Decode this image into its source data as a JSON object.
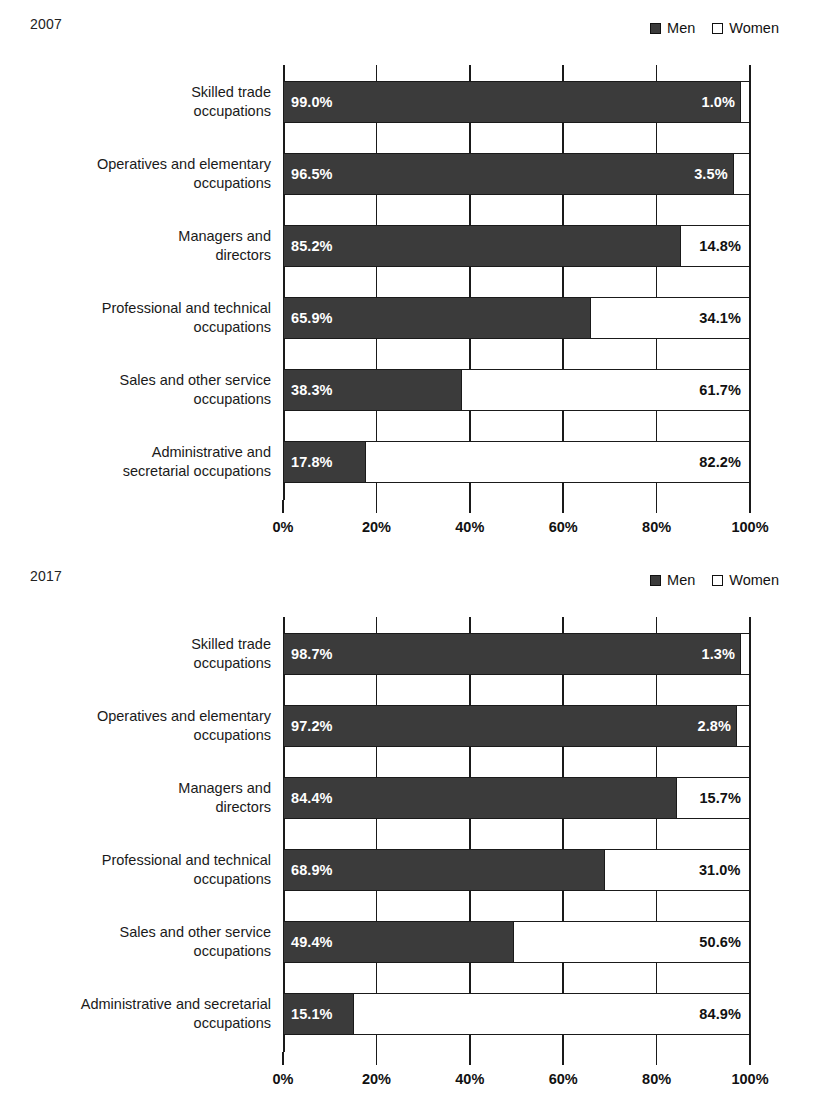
{
  "charts": [
    {
      "year": "2007",
      "legend": [
        {
          "label": "Men",
          "swatch": "filled-square-icon",
          "color": "#3b3b3b"
        },
        {
          "label": "Women",
          "swatch": "open-square-icon",
          "color": "#ffffff"
        }
      ],
      "x_tick_labels": [
        "0%",
        "20%",
        "40%",
        "60%",
        "80%",
        "100%"
      ],
      "rows": [
        {
          "label": "Skilled trade\noccupations",
          "men": 99.0,
          "women": 1.0,
          "men_label": "99.0%",
          "women_label": "1.0%",
          "women_label_outside": true
        },
        {
          "label": "Operatives and elementary\noccupations",
          "men": 96.5,
          "women": 3.5,
          "men_label": "96.5%",
          "women_label": "3.5%",
          "women_label_outside": true
        },
        {
          "label": "Managers and\ndirectors",
          "men": 85.2,
          "women": 14.8,
          "men_label": "85.2%",
          "women_label": "14.8%",
          "women_label_outside": false
        },
        {
          "label": "Professional and technical\noccupations",
          "men": 65.9,
          "women": 34.1,
          "men_label": "65.9%",
          "women_label": "34.1%",
          "women_label_outside": false
        },
        {
          "label": "Sales and other service\noccupations",
          "men": 38.3,
          "women": 61.7,
          "men_label": "38.3%",
          "women_label": "61.7%",
          "women_label_outside": false
        },
        {
          "label": "Administrative and\nsecretarial occupations",
          "men": 17.8,
          "women": 82.2,
          "men_label": "17.8%",
          "women_label": "82.2%",
          "women_label_outside": false
        }
      ]
    },
    {
      "year": "2017",
      "legend": [
        {
          "label": "Men",
          "swatch": "filled-square-icon",
          "color": "#3b3b3b"
        },
        {
          "label": "Women",
          "swatch": "open-square-icon",
          "color": "#ffffff"
        }
      ],
      "x_tick_labels": [
        "0%",
        "20%",
        "40%",
        "60%",
        "80%",
        "100%"
      ],
      "rows": [
        {
          "label": "Skilled trade\noccupations",
          "men": 98.7,
          "women": 1.3,
          "men_label": "98.7%",
          "women_label": "1.3%",
          "women_label_outside": true
        },
        {
          "label": "Operatives and elementary\noccupations",
          "men": 97.2,
          "women": 2.8,
          "men_label": "97.2%",
          "women_label": "2.8%",
          "women_label_outside": true
        },
        {
          "label": "Managers and\ndirectors",
          "men": 84.4,
          "women": 15.7,
          "men_label": "84.4%",
          "women_label": "15.7%",
          "women_label_outside": false
        },
        {
          "label": "Professional and technical\noccupations",
          "men": 68.9,
          "women": 31.0,
          "men_label": "68.9%",
          "women_label": "31.0%",
          "women_label_outside": false
        },
        {
          "label": "Sales and other service\noccupations",
          "men": 49.4,
          "women": 50.6,
          "men_label": "49.4%",
          "women_label": "50.6%",
          "women_label_outside": false
        },
        {
          "label": "Administrative and secretarial\noccupations",
          "men": 15.1,
          "women": 84.9,
          "men_label": "15.1%",
          "women_label": "84.9%",
          "women_label_outside": false
        }
      ]
    }
  ],
  "chart_data": [
    {
      "type": "bar",
      "orientation": "horizontal",
      "stacked": true,
      "normalized_to_100": true,
      "title": "2007",
      "xlabel": "",
      "ylabel": "",
      "xlim": [
        0,
        100
      ],
      "xticks": [
        0,
        20,
        40,
        60,
        80,
        100
      ],
      "xtick_labels": [
        "0%",
        "20%",
        "40%",
        "60%",
        "80%",
        "100%"
      ],
      "grid": "vertical",
      "legend_position": "top-right",
      "categories": [
        "Skilled trade occupations",
        "Operatives and elementary occupations",
        "Managers and directors",
        "Professional and technical occupations",
        "Sales and other service occupations",
        "Administrative and secretarial occupations"
      ],
      "series": [
        {
          "name": "Men",
          "color": "#3b3b3b",
          "values": [
            99.0,
            96.5,
            85.2,
            65.9,
            38.3,
            17.8
          ]
        },
        {
          "name": "Women",
          "color": "#ffffff",
          "values": [
            1.0,
            3.5,
            14.8,
            34.1,
            61.7,
            82.2
          ]
        }
      ],
      "data_labels": [
        [
          "99.0%",
          "1.0%"
        ],
        [
          "96.5%",
          "3.5%"
        ],
        [
          "85.2%",
          "14.8%"
        ],
        [
          "65.9%",
          "34.1%"
        ],
        [
          "38.3%",
          "61.7%"
        ],
        [
          "17.8%",
          "82.2%"
        ]
      ]
    },
    {
      "type": "bar",
      "orientation": "horizontal",
      "stacked": true,
      "normalized_to_100": true,
      "title": "2017",
      "xlabel": "",
      "ylabel": "",
      "xlim": [
        0,
        100
      ],
      "xticks": [
        0,
        20,
        40,
        60,
        80,
        100
      ],
      "xtick_labels": [
        "0%",
        "20%",
        "40%",
        "60%",
        "80%",
        "100%"
      ],
      "grid": "vertical",
      "legend_position": "top-right",
      "categories": [
        "Skilled trade occupations",
        "Operatives and elementary occupations",
        "Managers and directors",
        "Professional and technical occupations",
        "Sales and other service occupations",
        "Administrative and secretarial occupations"
      ],
      "series": [
        {
          "name": "Men",
          "color": "#3b3b3b",
          "values": [
            98.7,
            97.2,
            84.4,
            68.9,
            49.4,
            15.1
          ]
        },
        {
          "name": "Women",
          "color": "#ffffff",
          "values": [
            1.3,
            2.8,
            15.7,
            31.0,
            50.6,
            84.9
          ]
        }
      ],
      "data_labels": [
        [
          "98.7%",
          "1.3%"
        ],
        [
          "97.2%",
          "2.8%"
        ],
        [
          "84.4%",
          "15.7%"
        ],
        [
          "68.9%",
          "31.0%"
        ],
        [
          "49.4%",
          "50.6%"
        ],
        [
          "15.1%",
          "84.9%"
        ]
      ]
    }
  ]
}
